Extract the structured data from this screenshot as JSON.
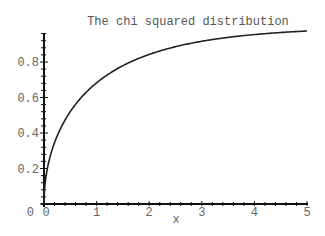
{
  "chart_data": {
    "type": "line",
    "title": "The chi squared distribution",
    "xlabel": "x",
    "ylabel": "",
    "xlim": [
      0,
      5
    ],
    "ylim": [
      0,
      0.98
    ],
    "grid": false,
    "legend": null,
    "x_ticks": [
      0,
      1,
      2,
      3,
      4,
      5
    ],
    "x_tick_labels": [
      "0",
      "1",
      "2",
      "3",
      "4",
      "5"
    ],
    "y_ticks": [
      0,
      0.2,
      0.4,
      0.6,
      0.8
    ],
    "y_tick_labels": [
      "0",
      "0.2",
      "0.4",
      "0.6",
      "0.8"
    ],
    "series": [
      {
        "name": "chi-squared CDF (1 d.f.)",
        "color": "#222222",
        "x": [
          0,
          0.05,
          0.1,
          0.2,
          0.3,
          0.4,
          0.5,
          0.75,
          1,
          1.25,
          1.5,
          2,
          2.5,
          3,
          3.5,
          4,
          4.5,
          5
        ],
        "y": [
          0,
          0.177,
          0.248,
          0.345,
          0.416,
          0.473,
          0.52,
          0.614,
          0.683,
          0.736,
          0.779,
          0.843,
          0.886,
          0.917,
          0.939,
          0.954,
          0.966,
          0.975
        ]
      }
    ]
  }
}
